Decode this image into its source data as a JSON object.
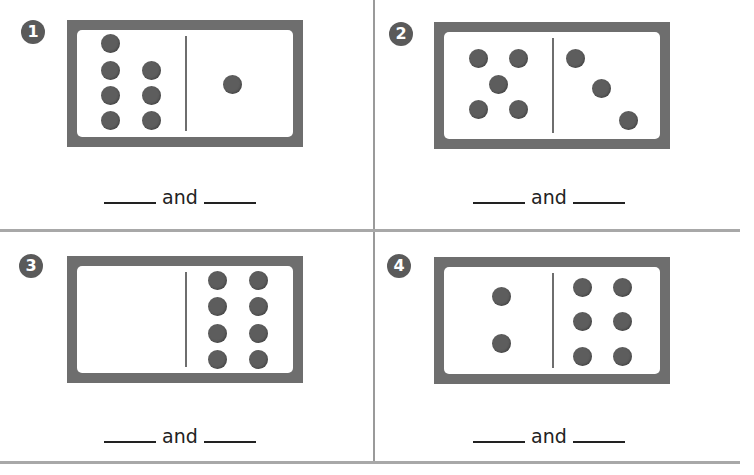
{
  "worksheet": {
    "problems": [
      {
        "number": "1",
        "left_pips": 7,
        "right_pips": 1,
        "connector": "and",
        "blank_left": "",
        "blank_right": ""
      },
      {
        "number": "2",
        "left_pips": 5,
        "right_pips": 3,
        "connector": "and",
        "blank_left": "",
        "blank_right": ""
      },
      {
        "number": "3",
        "left_pips": 0,
        "right_pips": 8,
        "connector": "and",
        "blank_left": "",
        "blank_right": ""
      },
      {
        "number": "4",
        "left_pips": 2,
        "right_pips": 6,
        "connector": "and",
        "blank_left": "",
        "blank_right": ""
      }
    ]
  },
  "colors": {
    "domino_frame": "#6e6e6e",
    "pip": "#5d5d5d",
    "badge": "#5a5a5a",
    "divider": "#a8a8a8"
  }
}
